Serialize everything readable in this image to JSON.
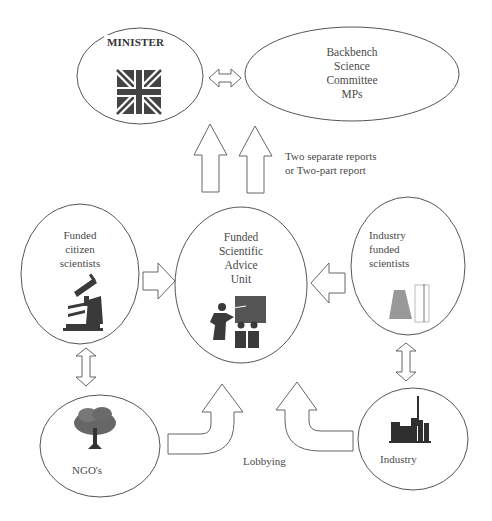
{
  "diagram": {
    "type": "flow-diagram",
    "colors": {
      "stroke": "#555555",
      "icon_fill": "#333333",
      "text": "#4a4a4a",
      "background": "#ffffff"
    },
    "nodes": {
      "minister": {
        "label": "MINISTER",
        "icon": "union-jack-flag-icon"
      },
      "backbench": {
        "label_lines": [
          "Backbench",
          "Science",
          "Committee",
          "MPs"
        ]
      },
      "citizen": {
        "label_lines": [
          "Funded",
          "citizen",
          "scientists"
        ],
        "icon": "microscope-icon"
      },
      "advice_unit": {
        "label_lines": [
          "Funded",
          "Scientific",
          "Advice",
          "Unit"
        ],
        "icon": "presenter-audience-icon"
      },
      "industry_scientists": {
        "label_lines": [
          "Industry",
          "funded",
          "scientists"
        ],
        "icon": "lab-flask-icon"
      },
      "ngos": {
        "label": "NGO's",
        "icon": "tree-icon"
      },
      "industry": {
        "label": "Industry",
        "icon": "factory-icon"
      }
    },
    "annotations": {
      "reports_line1": "Two separate reports",
      "reports_line2": "or Two-part report",
      "lobbying": "Lobbying"
    },
    "edges": [
      {
        "from": "minister",
        "to": "backbench",
        "kind": "double-arrow"
      },
      {
        "from": "advice_unit",
        "to": "minister",
        "kind": "up-arrow"
      },
      {
        "from": "advice_unit",
        "to": "backbench",
        "kind": "up-arrow"
      },
      {
        "from": "citizen",
        "to": "advice_unit",
        "kind": "right-arrow"
      },
      {
        "from": "industry_scientists",
        "to": "advice_unit",
        "kind": "left-arrow"
      },
      {
        "from": "citizen",
        "to": "ngos",
        "kind": "double-arrow"
      },
      {
        "from": "industry_scientists",
        "to": "industry",
        "kind": "double-arrow"
      },
      {
        "from": "ngos",
        "to": "advice_unit",
        "kind": "curved-arrow",
        "label": "Lobbying"
      },
      {
        "from": "industry",
        "to": "advice_unit",
        "kind": "curved-arrow",
        "label": "Lobbying"
      }
    ]
  }
}
